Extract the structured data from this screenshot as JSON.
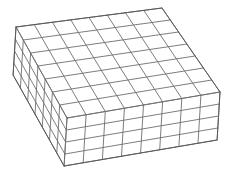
{
  "figure": {
    "type": "wireframe-box",
    "line_color": "#6e6e6e",
    "background": "#ffffff",
    "top_face": {
      "corners": {
        "back_left": [
          16,
          27
        ],
        "back_right": [
          162,
          8
        ],
        "right": [
          220,
          92
        ],
        "front": [
          67,
          118
        ]
      },
      "divisions_u": 8,
      "divisions_v": 7
    },
    "height_px": 48,
    "side_rows": 4
  }
}
